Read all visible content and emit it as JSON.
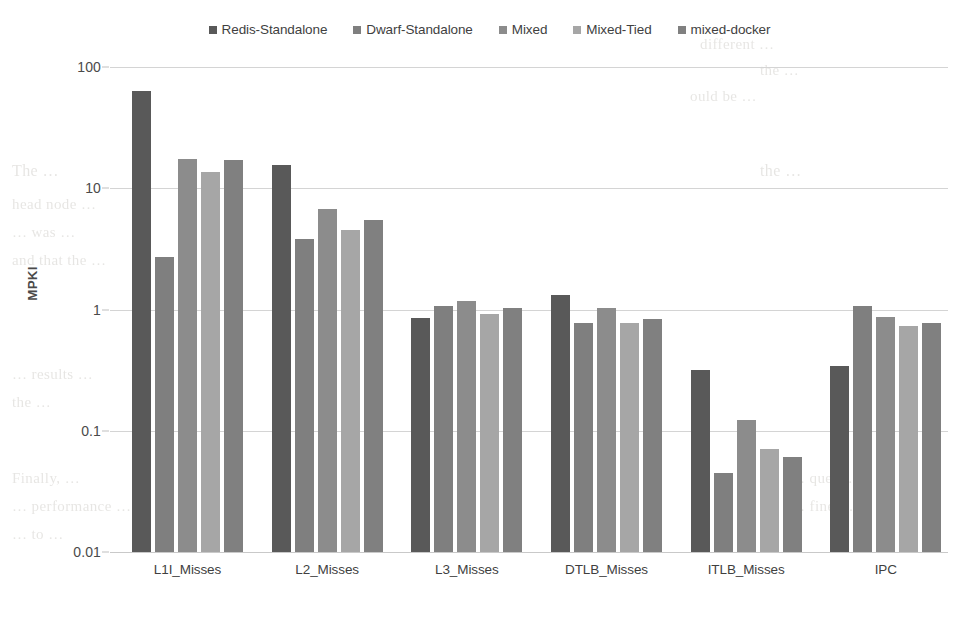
{
  "chart_data": {
    "type": "bar",
    "title": "",
    "xlabel": "",
    "ylabel": "MPKI",
    "yscale": "log",
    "ylim": [
      0.01,
      100
    ],
    "ytick_labels": [
      "100",
      "10",
      "1",
      "0.1",
      "0.01"
    ],
    "ytick_values": [
      100,
      10,
      1,
      0.1,
      0.01
    ],
    "grid": true,
    "legend_position": "top-center",
    "categories": [
      "L1I_Misses",
      "L2_Misses",
      "L3_Misses",
      "DTLB_Misses",
      "ITLB_Misses",
      "IPC"
    ],
    "series": [
      {
        "name": "Redis-Standalone",
        "color": "#595959",
        "values": [
          64,
          15.5,
          0.85,
          1.31,
          0.32,
          0.34
        ]
      },
      {
        "name": "Dwarf-Standalone",
        "color": "#7f7f7f",
        "values": [
          2.7,
          3.8,
          1.06,
          0.78,
          0.045,
          1.06
        ]
      },
      {
        "name": "Mixed",
        "color": "#8c8c8c",
        "values": [
          17.5,
          6.8,
          1.17,
          1.02,
          0.122,
          0.87
        ]
      },
      {
        "name": "Mixed-Tied",
        "color": "#a6a6a6",
        "values": [
          13.5,
          4.5,
          0.91,
          0.78,
          0.071,
          0.73
        ]
      },
      {
        "name": "mixed-docker",
        "color": "#808080",
        "values": [
          17.0,
          5.5,
          1.03,
          0.83,
          0.061,
          0.77
        ]
      }
    ]
  },
  "background_text": [
    {
      "text": "different …",
      "x": 700,
      "y": 36,
      "size": 15
    },
    {
      "text": "the …",
      "x": 760,
      "y": 62,
      "size": 15
    },
    {
      "text": "ould be …",
      "x": 690,
      "y": 88,
      "size": 15
    },
    {
      "text": "The …",
      "x": 12,
      "y": 162,
      "size": 16
    },
    {
      "text": "the …",
      "x": 760,
      "y": 162,
      "size": 16
    },
    {
      "text": "head node …",
      "x": 12,
      "y": 196,
      "size": 15
    },
    {
      "text": "… was …",
      "x": 12,
      "y": 224,
      "size": 15
    },
    {
      "text": "and that the …",
      "x": 12,
      "y": 252,
      "size": 15
    },
    {
      "text": "… results …",
      "x": 12,
      "y": 366,
      "size": 15
    },
    {
      "text": "the …",
      "x": 12,
      "y": 394,
      "size": 15
    },
    {
      "text": "Finally, …",
      "x": 12,
      "y": 470,
      "size": 15
    },
    {
      "text": "… performance …",
      "x": 12,
      "y": 498,
      "size": 15
    },
    {
      "text": "… to …",
      "x": 12,
      "y": 526,
      "size": 15
    },
    {
      "text": "… ques …",
      "x": 790,
      "y": 470,
      "size": 15
    },
    {
      "text": "… fine …",
      "x": 790,
      "y": 498,
      "size": 15
    }
  ]
}
